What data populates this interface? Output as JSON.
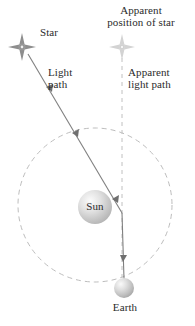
{
  "diagram": {
    "labels": {
      "apparent_position_of_star": "Apparent\nposition of star",
      "star": "Star",
      "light_path": "Light\npath",
      "apparent_light_path": "Apparent\nlight path",
      "sun": "Sun",
      "earth": "Earth"
    },
    "colors": {
      "line": "#7a7a7a",
      "dashed": "#b9b9b9",
      "text": "#2b2b2b",
      "sun_fill": "#c9c9c9",
      "sun_highlight": "#f2f2f2",
      "earth_fill": "#bdbdbd",
      "earth_highlight": "#f0f0f0",
      "star_fill": "#9a9a9a",
      "apparent_star_fill": "#cfcfcf",
      "background": "#ffffff"
    },
    "geometry": {
      "star_position": [
        22,
        47
      ],
      "apparent_star_position": [
        122,
        47
      ],
      "sun_center": [
        95,
        207
      ],
      "sun_radius": 17,
      "earth_center": [
        124,
        288
      ],
      "earth_radius": 10,
      "orbit_center": [
        95,
        205
      ],
      "orbit_radius": 77,
      "bend_point": [
        122,
        213
      ]
    }
  }
}
